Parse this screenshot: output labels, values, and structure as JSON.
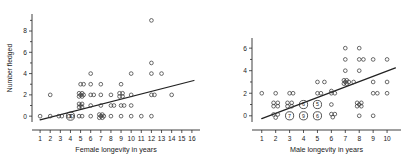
{
  "figure": {
    "background": "#ffffff",
    "marker_color": "#3a3a3a",
    "line_color": "#222222",
    "axis_color": "#2a2a2a"
  },
  "chart_data": [
    {
      "type": "scatter",
      "panel_name": "female-longevity",
      "title": "",
      "xlabel": "Female longevity in years",
      "ylabel": "Number fledged",
      "xlim": [
        0.2,
        16.8
      ],
      "ylim": [
        -0.55,
        9.6
      ],
      "xticks": [
        1,
        2,
        3,
        4,
        5,
        6,
        7,
        8,
        9,
        10,
        11,
        12,
        13,
        14,
        15,
        16
      ],
      "xticklabels": [
        "1",
        "2",
        "3",
        "4",
        "5",
        "6",
        "7",
        "8",
        "9",
        "10",
        "11",
        "12",
        "13",
        "14",
        "15",
        "16"
      ],
      "yticks": [
        0,
        2,
        4,
        6,
        8
      ],
      "yticklabels": [
        "0",
        "2",
        "4",
        "6",
        "8"
      ],
      "grid": false,
      "legend": "none",
      "points": [
        [
          1,
          0
        ],
        [
          2,
          0
        ],
        [
          2,
          2
        ],
        [
          2.85,
          0
        ],
        [
          3.15,
          0
        ],
        [
          3.85,
          0
        ],
        [
          4.15,
          0
        ],
        [
          4.85,
          0
        ],
        [
          5.15,
          0
        ],
        [
          5,
          1
        ],
        [
          5,
          2
        ],
        [
          5,
          3
        ],
        [
          5.3,
          2
        ],
        [
          5.3,
          3
        ],
        [
          4.85,
          2.15
        ],
        [
          5.15,
          2.15
        ],
        [
          4.85,
          1.85
        ],
        [
          5.15,
          1.85
        ],
        [
          4.85,
          1.15
        ],
        [
          5.15,
          1.15
        ],
        [
          4.85,
          0.85
        ],
        [
          5.15,
          0.85
        ],
        [
          6,
          0
        ],
        [
          6,
          1
        ],
        [
          6,
          2
        ],
        [
          6.3,
          2
        ],
        [
          6,
          3
        ],
        [
          6,
          4
        ],
        [
          7,
          0
        ],
        [
          7.3,
          0
        ],
        [
          6.85,
          0.15
        ],
        [
          7.15,
          0.15
        ],
        [
          6.85,
          -0.15
        ],
        [
          7.15,
          -0.15
        ],
        [
          7,
          1
        ],
        [
          7,
          2
        ],
        [
          7,
          3
        ],
        [
          8,
          0
        ],
        [
          8,
          1
        ],
        [
          8,
          2
        ],
        [
          8.3,
          1
        ],
        [
          9,
          0
        ],
        [
          9,
          1
        ],
        [
          9.3,
          1
        ],
        [
          9,
          3
        ],
        [
          8.85,
          2.15
        ],
        [
          9.15,
          2.15
        ],
        [
          8.85,
          1.85
        ],
        [
          9.15,
          1.85
        ],
        [
          10,
          0
        ],
        [
          10,
          1
        ],
        [
          10,
          2
        ],
        [
          10,
          4
        ],
        [
          11,
          0
        ],
        [
          12,
          0
        ],
        [
          12,
          2
        ],
        [
          12.3,
          2
        ],
        [
          12,
          4
        ],
        [
          12,
          5
        ],
        [
          12,
          9
        ],
        [
          13,
          4
        ],
        [
          14,
          2
        ]
      ],
      "overlap_clusters": [
        {
          "x": 4,
          "y": 0,
          "count": 9,
          "annotated": true,
          "label": "9"
        }
      ],
      "fit_line": {
        "x0": 1.0,
        "y0": -0.35,
        "x1": 16.2,
        "y1": 3.35
      }
    },
    {
      "type": "scatter",
      "panel_name": "male-longevity",
      "title": "",
      "xlabel": "Male longevity in years",
      "ylabel": "",
      "xlim": [
        0.3,
        11.0
      ],
      "ylim": [
        -0.55,
        6.9
      ],
      "xticks": [
        1,
        2,
        3,
        4,
        5,
        6,
        7,
        8,
        9,
        10
      ],
      "xticklabels": [
        "1",
        "2",
        "3",
        "4",
        "5",
        "6",
        "7",
        "8",
        "9",
        "10"
      ],
      "yticks": [
        0,
        2,
        4,
        6
      ],
      "yticklabels": [
        "0",
        "2",
        "4",
        "6"
      ],
      "grid": false,
      "legend": "none",
      "points": [
        [
          1,
          2
        ],
        [
          2,
          2
        ],
        [
          3,
          2
        ],
        [
          3.25,
          2
        ],
        [
          1.85,
          1.15
        ],
        [
          2.15,
          1.15
        ],
        [
          1.85,
          0.85
        ],
        [
          2.15,
          0.85
        ],
        [
          2.85,
          1.15
        ],
        [
          3.15,
          1.15
        ],
        [
          2.85,
          0.85
        ],
        [
          3.15,
          0.85
        ],
        [
          1.85,
          0.12
        ],
        [
          2.15,
          0.12
        ],
        [
          2.0,
          -0.16
        ],
        [
          5,
          2
        ],
        [
          5.25,
          2
        ],
        [
          5,
          3
        ],
        [
          5.5,
          3
        ],
        [
          6,
          2
        ],
        [
          6,
          2.2
        ],
        [
          6.25,
          2
        ],
        [
          6,
          1
        ],
        [
          6,
          0.15
        ],
        [
          6.25,
          0.15
        ],
        [
          6.1,
          -0.12
        ],
        [
          7,
          3
        ],
        [
          7.25,
          3
        ],
        [
          6.9,
          3.15
        ],
        [
          7.1,
          3.15
        ],
        [
          6.9,
          2.85
        ],
        [
          7.1,
          2.85
        ],
        [
          7,
          4
        ],
        [
          7,
          5
        ],
        [
          7,
          6
        ],
        [
          7.6,
          3
        ],
        [
          8,
          6
        ],
        [
          8,
          4
        ],
        [
          8,
          1
        ],
        [
          8,
          0
        ],
        [
          8,
          5
        ],
        [
          8.3,
          5
        ],
        [
          7.85,
          1.15
        ],
        [
          8.15,
          1.15
        ],
        [
          7.85,
          0.85
        ],
        [
          8.15,
          0.85
        ],
        [
          9,
          0
        ],
        [
          9,
          2
        ],
        [
          9.3,
          2
        ],
        [
          9,
          5
        ],
        [
          9,
          3
        ],
        [
          10,
          2
        ],
        [
          10,
          5
        ],
        [
          10,
          3
        ]
      ],
      "overlap_clusters": [
        {
          "x": 4,
          "y": 1,
          "count": 6,
          "annotated": true,
          "label": "6"
        },
        {
          "x": 5,
          "y": 1,
          "count": 5,
          "annotated": true,
          "label": "5"
        },
        {
          "x": 3,
          "y": 0,
          "count": 7,
          "annotated": true,
          "label": "7"
        },
        {
          "x": 4,
          "y": 0,
          "count": 9,
          "annotated": true,
          "label": "9"
        },
        {
          "x": 5,
          "y": 0,
          "count": 6,
          "annotated": true,
          "label": "6"
        }
      ],
      "fit_line": {
        "x0": 1.0,
        "y0": -0.25,
        "x1": 10.6,
        "y1": 4.25
      }
    }
  ]
}
